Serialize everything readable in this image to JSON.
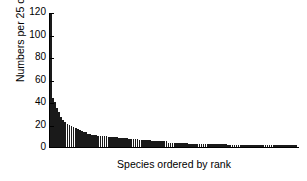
{
  "chart_data": {
    "type": "bar",
    "title": "",
    "subtitle": "",
    "xlabel": "Species ordered by rank",
    "ylabel": "Numbers per 25 cm2",
    "ylabel_html": "Numbers per 25 cm<sup>2</sup>",
    "ylim": [
      0,
      120
    ],
    "yticks": [
      0,
      20,
      40,
      60,
      80,
      100,
      120
    ],
    "ytick_labels": [
      "0",
      "20",
      "40",
      "60",
      "80",
      "100",
      "120"
    ],
    "xticks": [],
    "xtick_labels": [],
    "grid": false,
    "legend": null,
    "legend_position": "none",
    "bar_color": "#1a1a1a",
    "axis_color": "#000000",
    "background_color": "#ffffff",
    "n_categories": 120,
    "categories": [
      "1",
      "2",
      "3",
      "4",
      "5",
      "6",
      "7",
      "8",
      "9",
      "10",
      "11",
      "12",
      "13",
      "14",
      "15",
      "16",
      "17",
      "18",
      "19",
      "20",
      "21",
      "22",
      "23",
      "24",
      "25",
      "26",
      "27",
      "28",
      "29",
      "30",
      "31",
      "32",
      "33",
      "34",
      "35",
      "36",
      "37",
      "38",
      "39",
      "40",
      "41",
      "42",
      "43",
      "44",
      "45",
      "46",
      "47",
      "48",
      "49",
      "50",
      "51",
      "52",
      "53",
      "54",
      "55",
      "56",
      "57",
      "58",
      "59",
      "60",
      "61",
      "62",
      "63",
      "64",
      "65",
      "66",
      "67",
      "68",
      "69",
      "70",
      "71",
      "72",
      "73",
      "74",
      "75",
      "76",
      "77",
      "78",
      "79",
      "80",
      "81",
      "82",
      "83",
      "84",
      "85",
      "86",
      "87",
      "88",
      "89",
      "90",
      "91",
      "92",
      "93",
      "94",
      "95",
      "96",
      "97",
      "98",
      "99",
      "100",
      "101",
      "102",
      "103",
      "104",
      "105",
      "106",
      "107",
      "108",
      "109",
      "110",
      "111",
      "112",
      "113",
      "114",
      "115",
      "116",
      "117",
      "118",
      "119",
      "120"
    ],
    "values": [
      120,
      44,
      40,
      35,
      31,
      27,
      24,
      22,
      21,
      20,
      19,
      18,
      17,
      16,
      15,
      14,
      13,
      13,
      12,
      12,
      11,
      11,
      11,
      10,
      10,
      10,
      10,
      10,
      9,
      9,
      9,
      9,
      9,
      8,
      8,
      8,
      8,
      8,
      7,
      7,
      7,
      7,
      7,
      6,
      6,
      6,
      6,
      6,
      6,
      5,
      5,
      5,
      5,
      5,
      5,
      5,
      5,
      4,
      4,
      4,
      4,
      4,
      4,
      4,
      4,
      4,
      4,
      3,
      3,
      3,
      3,
      3,
      3,
      3,
      3,
      3,
      3,
      3,
      3,
      3,
      3,
      3,
      3,
      3,
      3,
      3,
      2,
      2,
      2,
      2,
      2,
      2,
      2,
      2,
      2,
      2,
      2,
      2,
      2,
      2,
      2,
      2,
      2,
      2,
      2,
      2,
      2,
      2,
      2,
      2,
      2,
      2,
      2,
      2,
      2,
      2,
      2,
      2,
      2,
      2
    ]
  }
}
